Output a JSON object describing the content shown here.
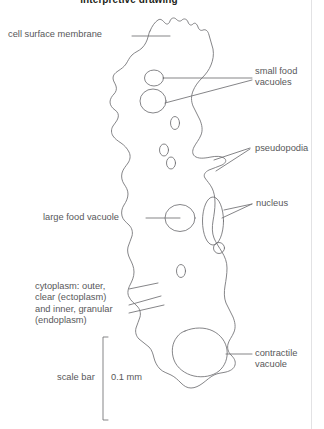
{
  "figure": {
    "title": "interpretive drawing",
    "line_color": "#6f6f72",
    "text_color": "#58585a",
    "title_color": "#231f20",
    "background": "#ffffff",
    "width": 324,
    "height": 429
  },
  "labels": {
    "cell_surface_membrane": "cell surface membrane",
    "small_food_vacuoles": "small food\nvacuoles",
    "pseudopodia": "pseudopodia",
    "nucleus": "nucleus",
    "large_food_vacuole": "large food vacuole",
    "cytoplasm": "cytoplasm: outer,\nclear (ectoplasm)\nand inner, granular\n(endoplasm)",
    "contractile_vacuole": "contractile\nvacuole",
    "scale_bar": "scale bar",
    "scale_value": "0.1 mm"
  },
  "icons": {
    "cell_outline": "cell-outline-shape",
    "nucleus_shape": "nucleus-oval",
    "large_vacuole_shape": "large-vacuole-circle",
    "contractile_vacuole_shape": "contractile-vacuole-blob",
    "scale_bracket": "scale-bar-bracket"
  }
}
